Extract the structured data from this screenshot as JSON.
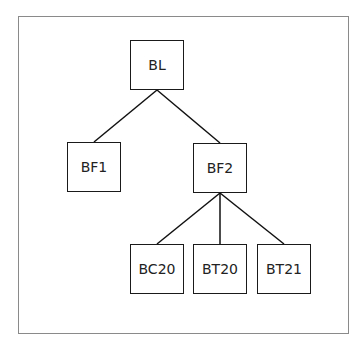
{
  "diagram": {
    "type": "tree",
    "nodes": [
      {
        "id": "BL",
        "label": "BL",
        "x": 130,
        "y": 40
      },
      {
        "id": "BF1",
        "label": "BF1",
        "x": 67,
        "y": 142
      },
      {
        "id": "BF2",
        "label": "BF2",
        "x": 193,
        "y": 143
      },
      {
        "id": "BC20",
        "label": "BC20",
        "x": 130,
        "y": 244
      },
      {
        "id": "BT20",
        "label": "BT20",
        "x": 193,
        "y": 244
      },
      {
        "id": "BT21",
        "label": "BT21",
        "x": 257,
        "y": 244
      }
    ],
    "edges": [
      {
        "from": "BL",
        "to": "BF1"
      },
      {
        "from": "BL",
        "to": "BF2"
      },
      {
        "from": "BF2",
        "to": "BC20"
      },
      {
        "from": "BF2",
        "to": "BT20"
      },
      {
        "from": "BF2",
        "to": "BT21"
      }
    ]
  }
}
